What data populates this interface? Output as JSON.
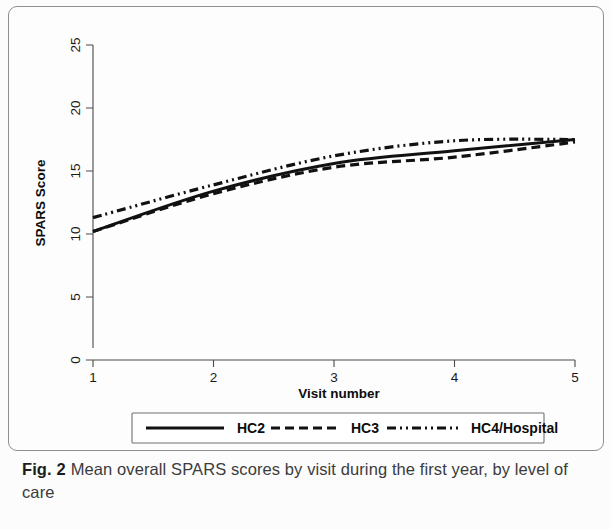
{
  "figure": {
    "caption_label": "Fig. 2",
    "caption_text": "Mean overall SPARS scores by visit during the first year, by level of care"
  },
  "chart_data": {
    "type": "line",
    "title": "",
    "subtitle": "",
    "xlabel": "Visit number",
    "ylabel": "SPARS Score",
    "x": [
      1,
      2,
      3,
      4,
      5
    ],
    "xlim": [
      1,
      5
    ],
    "ylim": [
      0,
      25
    ],
    "xticks": [
      1,
      2,
      3,
      4,
      5
    ],
    "xtick_labels": [
      "1",
      "2",
      "3",
      "4",
      "5"
    ],
    "yticks": [
      0,
      5,
      10,
      15,
      20,
      25
    ],
    "ytick_labels": [
      "0",
      "5",
      "10",
      "15",
      "20",
      "25"
    ],
    "grid": false,
    "legend_position": "below-axes",
    "series": [
      {
        "name": "HC2",
        "style": "solid",
        "color": "#111111",
        "values": [
          10.2,
          13.4,
          15.6,
          16.6,
          17.5
        ]
      },
      {
        "name": "HC3",
        "style": "dashed",
        "color": "#111111",
        "values": [
          10.2,
          13.2,
          15.3,
          16.1,
          17.3
        ]
      },
      {
        "name": "HC4/Hospital",
        "style": "dash-dot-dot",
        "color": "#111111",
        "values": [
          11.3,
          13.9,
          16.2,
          17.4,
          17.5
        ]
      }
    ]
  }
}
